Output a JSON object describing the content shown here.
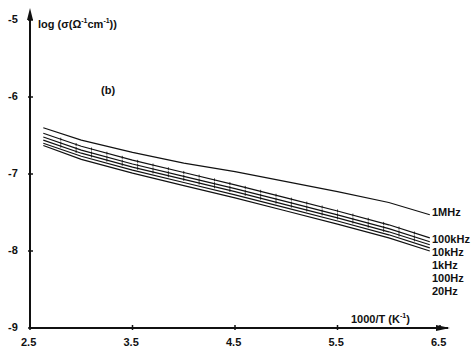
{
  "chart_data": {
    "type": "line",
    "title": "",
    "panel_label": "(b)",
    "xlabel": "1000/T (K-1)",
    "ylabel": "log (σ(Ω-1cm-1))",
    "xlim": [
      2.5,
      6.5
    ],
    "ylim": [
      -9,
      -5
    ],
    "x_ticks": [
      "2.5",
      "3.5",
      "4.5",
      "5.5",
      "6.5"
    ],
    "y_ticks": [
      "-5",
      "-6",
      "-7",
      "-8",
      "-9"
    ],
    "grid": false,
    "legend_position": "right, inline labels at curve ends",
    "x": [
      2.63,
      3.0,
      3.5,
      4.0,
      4.5,
      5.0,
      5.5,
      6.0,
      6.4
    ],
    "series": [
      {
        "name": "1MHz",
        "values": [
          -6.4,
          -6.56,
          -6.72,
          -6.86,
          -6.97,
          -7.1,
          -7.23,
          -7.37,
          -7.53
        ]
      },
      {
        "name": "100kHz",
        "values": [
          -6.47,
          -6.64,
          -6.82,
          -6.98,
          -7.14,
          -7.31,
          -7.48,
          -7.66,
          -7.83
        ]
      },
      {
        "name": "10kHz",
        "values": [
          -6.52,
          -6.69,
          -6.87,
          -7.03,
          -7.19,
          -7.36,
          -7.53,
          -7.71,
          -7.88
        ]
      },
      {
        "name": "1kHz",
        "values": [
          -6.56,
          -6.73,
          -6.91,
          -7.07,
          -7.23,
          -7.4,
          -7.57,
          -7.75,
          -7.92
        ]
      },
      {
        "name": "100Hz",
        "values": [
          -6.6,
          -6.77,
          -6.95,
          -7.11,
          -7.27,
          -7.44,
          -7.61,
          -7.79,
          -7.96
        ]
      },
      {
        "name": "20Hz",
        "values": [
          -6.63,
          -6.81,
          -6.99,
          -7.15,
          -7.31,
          -7.48,
          -7.65,
          -7.83,
          -8.0
        ]
      }
    ]
  },
  "labels": {
    "ylabel_main": "log (σ(Ω",
    "ylabel_sup1": "-1",
    "ylabel_mid": "cm",
    "ylabel_sup2": "-1",
    "ylabel_end": "))",
    "xlabel_main": "1000/T (K",
    "xlabel_sup": "-1",
    "xlabel_end": ")",
    "panel": "(b)"
  }
}
